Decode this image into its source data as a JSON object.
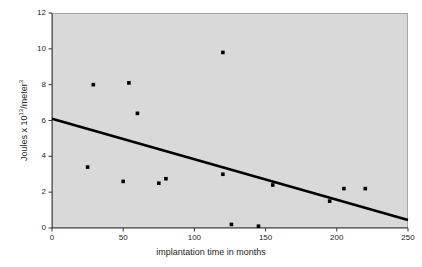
{
  "chart_data": {
    "type": "scatter",
    "title": "",
    "xlabel": "implantation time in months",
    "ylabel": "Joules x 10^13/meter^3",
    "ylabel_parts": {
      "prefix": "Joules x 10",
      "exp1": "13",
      "middle": "/meter",
      "exp2": "3"
    },
    "xlim": [
      0,
      250
    ],
    "ylim": [
      0,
      12
    ],
    "xticks": [
      0,
      50,
      100,
      150,
      200,
      250
    ],
    "yticks": [
      0,
      2,
      4,
      6,
      8,
      10,
      12
    ],
    "xtick_labels": [
      "0",
      "50",
      "100",
      "150",
      "200",
      "250"
    ],
    "ytick_labels": [
      "0",
      "2",
      "4",
      "6",
      "8",
      "10",
      "12"
    ],
    "grid": false,
    "legend": "none",
    "plot_background": "#d9d9d9",
    "marker_color": "#000000",
    "line_color": "#000000",
    "points": [
      {
        "x": 25,
        "y": 3.4
      },
      {
        "x": 29,
        "y": 8.0
      },
      {
        "x": 50,
        "y": 2.6
      },
      {
        "x": 54,
        "y": 8.1
      },
      {
        "x": 60,
        "y": 6.4
      },
      {
        "x": 75,
        "y": 2.5
      },
      {
        "x": 80,
        "y": 2.75
      },
      {
        "x": 120,
        "y": 9.8
      },
      {
        "x": 120,
        "y": 3.0
      },
      {
        "x": 126,
        "y": 0.2
      },
      {
        "x": 145,
        "y": 0.1
      },
      {
        "x": 155,
        "y": 2.4
      },
      {
        "x": 195,
        "y": 1.5
      },
      {
        "x": 205,
        "y": 2.2
      },
      {
        "x": 220,
        "y": 2.2
      }
    ],
    "trendline": {
      "name": "linear fit",
      "x0": 0,
      "y0": 6.1,
      "x1": 250,
      "y1": 0.45,
      "width": 2.6
    }
  }
}
